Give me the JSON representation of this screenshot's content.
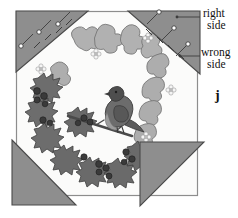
{
  "figure": {
    "label": "j",
    "callouts": [
      {
        "id": "right-side",
        "line1": "right",
        "line2": "side"
      },
      {
        "id": "wrong-side",
        "line1": "wrong",
        "line2": "side"
      }
    ]
  },
  "colors": {
    "background": "#ffffff",
    "panel_fill": "#fbfbfa",
    "panel_stroke": "#8d8d8d",
    "triangle_fill": "#8e8e8e",
    "triangle_stroke": "#4a4a4a",
    "holly_dark": "#6f6f6f",
    "holly_darker": "#545454",
    "ivy_light": "#b4b4b4",
    "ivy_mid": "#9d9d9d",
    "berry": "#3a3a3a",
    "bird_body": "#6a6a6a",
    "bird_dark": "#4a4a4a",
    "bird_breast": "#9a9a9a",
    "flower": "#f2f2f2",
    "text": "#111111",
    "leader": "#3c3c3c"
  },
  "panel": {
    "x": 16,
    "y": 11,
    "width": 182,
    "height": 185
  },
  "triangles": [
    {
      "name": "top-left-triangle",
      "side": "wrong",
      "points": "16,11 88,11 16,72",
      "pins": 3,
      "stitches": 4
    },
    {
      "name": "top-right-triangle",
      "side": "wrong",
      "points": "128,11 200,11 200,74",
      "pins": 3,
      "stitches": 4
    },
    {
      "name": "bottom-left-triangle",
      "side": "wrong",
      "points": "12,140 76,205 12,205",
      "pins": 0,
      "stitches": 0
    },
    {
      "name": "bottom-right-triangle",
      "side": "wrong",
      "points": "140,142 204,142 140,206",
      "pins": 0,
      "stitches": 0
    }
  ],
  "wreath": {
    "description": "Circular Christmas wreath of holly leaves with berries and ivy leaves with small white flowers",
    "bird": {
      "name": "robin",
      "present": true
    },
    "berry_count": 17,
    "flower_count": 5
  }
}
